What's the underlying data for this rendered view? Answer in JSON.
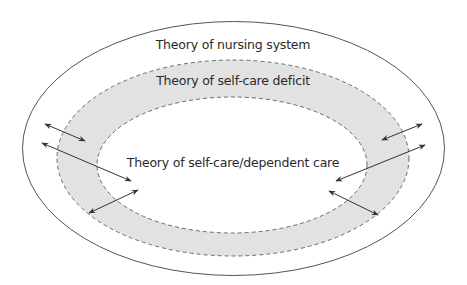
{
  "diagram": {
    "colors": {
      "band_fill": "#e2e2e2",
      "stroke": "#555555",
      "dash_stroke": "#6a6a6a",
      "text": "#2a2a2a"
    },
    "layers": [
      {
        "id": "outer",
        "label": "Theory of nursing system",
        "style": "solid"
      },
      {
        "id": "middle",
        "label": "Theory of self-care deficit",
        "style": "dashed-band-shaded"
      },
      {
        "id": "inner",
        "label": "Theory of self-care/dependent care",
        "style": "dashed"
      }
    ],
    "arrows": [
      {
        "side": "left",
        "type": "double-headed"
      },
      {
        "side": "left",
        "type": "double-headed"
      },
      {
        "side": "left",
        "type": "double-headed"
      },
      {
        "side": "right",
        "type": "double-headed"
      },
      {
        "side": "right",
        "type": "double-headed"
      },
      {
        "side": "right",
        "type": "double-headed"
      }
    ]
  }
}
